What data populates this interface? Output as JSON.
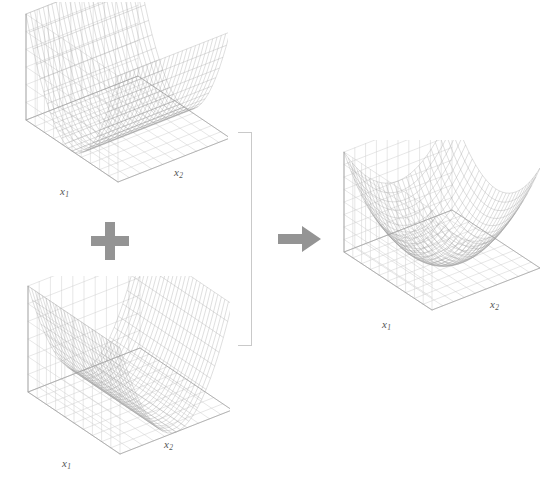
{
  "figure": {
    "type": "diagram",
    "background_color": "#ffffff",
    "mesh_color": "#9a9a9a",
    "box_color": "#cfcfcf",
    "operator_color": "#949494",
    "bracket_color": "#c9c9c9",
    "label_color": "#555555"
  },
  "operators": {
    "plus": {
      "name": "plus-sign",
      "glyph": "+"
    },
    "arrow": {
      "name": "right-arrow",
      "glyph": "→"
    },
    "bracket": {
      "name": "right-bracket",
      "glyph": "]"
    }
  },
  "panels": [
    {
      "id": "term-1",
      "name": "parabolic-trough-x1",
      "role": "addend",
      "axis_labels": {
        "x": "x",
        "x_sub": "1",
        "y": "x",
        "y_sub": "2"
      },
      "surface": {
        "kind": "trough",
        "varies_along": "x1",
        "formula": "f(x1,x2) = x1^2"
      }
    },
    {
      "id": "term-2",
      "name": "parabolic-trough-x2",
      "role": "addend",
      "axis_labels": {
        "x": "x",
        "x_sub": "1",
        "y": "x",
        "y_sub": "2"
      },
      "surface": {
        "kind": "trough",
        "varies_along": "x2",
        "formula": "f(x1,x2) = x2^2"
      }
    },
    {
      "id": "result",
      "name": "elliptic-paraboloid-bowl",
      "role": "sum",
      "axis_labels": {
        "x": "x",
        "x_sub": "1",
        "y": "x",
        "y_sub": "2"
      },
      "surface": {
        "kind": "paraboloid",
        "varies_along": "both",
        "formula": "f(x1,x2) = x1^2 + x2^2"
      }
    }
  ],
  "chart_data": {
    "type": "surface",
    "title": "",
    "panels": [
      {
        "label": "term-1",
        "formula": "z = x1^2",
        "x1_range": [
          -1,
          1
        ],
        "x2_range": [
          -1,
          1
        ],
        "z_range": [
          0,
          1
        ],
        "grid_n": 26
      },
      {
        "label": "term-2",
        "formula": "z = x2^2",
        "x1_range": [
          -1,
          1
        ],
        "x2_range": [
          -1,
          1
        ],
        "z_range": [
          0,
          1
        ],
        "grid_n": 26
      },
      {
        "label": "result",
        "formula": "z = x1^2 + x2^2",
        "x1_range": [
          -1,
          1
        ],
        "x2_range": [
          -1,
          1
        ],
        "z_range": [
          0,
          2
        ],
        "grid_n": 26
      }
    ]
  }
}
